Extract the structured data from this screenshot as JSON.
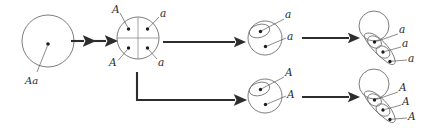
{
  "figure": {
    "background_color": "#ffffff",
    "line_color": "#6e6e6e",
    "arrow_color": "#2d2d2d",
    "nucleus_color": "#1d1d1d"
  },
  "stages": [
    {
      "id": "stage-1",
      "name": "parent-cell",
      "description": "Single round cell with one nucleus",
      "labels": [
        {
          "id": "s1-l1",
          "text": "Aa",
          "name": "label-Aa"
        }
      ]
    },
    {
      "id": "stage-2",
      "name": "four-nucleate-cell",
      "description": "Round cell divided into four quadrants, each containing one nucleus",
      "labels": [
        {
          "id": "s2-l1",
          "text": "A",
          "name": "label-A-top-left"
        },
        {
          "id": "s2-l2",
          "text": "a",
          "name": "label-a-top-right"
        },
        {
          "id": "s2-l3",
          "text": "A",
          "name": "label-A-bottom-left"
        },
        {
          "id": "s2-l4",
          "text": "a",
          "name": "label-a-bottom-right"
        }
      ]
    },
    {
      "id": "stage-3-top",
      "name": "budding-cell-a",
      "description": "Cell with one bud, two nuclei carrying allele a",
      "labels": [
        {
          "id": "s3t-l1",
          "text": "a",
          "name": "label-a-bud"
        },
        {
          "id": "s3t-l2",
          "text": "a",
          "name": "label-a-mother"
        }
      ]
    },
    {
      "id": "stage-3-bottom",
      "name": "budding-cell-A",
      "description": "Cell with one bud, two nuclei carrying allele A",
      "labels": [
        {
          "id": "s3b-l1",
          "text": "A",
          "name": "label-A-bud"
        },
        {
          "id": "s3b-l2",
          "text": "A",
          "name": "label-A-mother"
        }
      ]
    },
    {
      "id": "stage-4-top",
      "name": "bud-chain-a",
      "description": "Mother cell with a chain of three budded cells, each with one nucleus carrying allele a",
      "labels": [
        {
          "id": "s4t-l1",
          "text": "a",
          "name": "label-a-chain-1"
        },
        {
          "id": "s4t-l2",
          "text": "a",
          "name": "label-a-chain-2"
        },
        {
          "id": "s4t-l3",
          "text": "a",
          "name": "label-a-chain-3"
        }
      ]
    },
    {
      "id": "stage-4-bottom",
      "name": "bud-chain-A",
      "description": "Mother cell with a chain of three budded cells, each with one nucleus carrying allele A",
      "labels": [
        {
          "id": "s4b-l1",
          "text": "A",
          "name": "label-A-chain-1"
        },
        {
          "id": "s4b-l2",
          "text": "A",
          "name": "label-A-chain-2"
        },
        {
          "id": "s4b-l3",
          "text": "A",
          "name": "label-A-chain-3"
        }
      ]
    }
  ],
  "arrows": [
    {
      "id": "arrow-1",
      "name": "arrow-stage1-to-stage2-first",
      "direction": "right"
    },
    {
      "id": "arrow-2",
      "name": "arrow-stage1-to-stage2-second",
      "direction": "right"
    },
    {
      "id": "arrow-3",
      "name": "arrow-stage2-to-stage3-top",
      "direction": "right"
    },
    {
      "id": "arrow-4",
      "name": "arrow-stage2-to-stage3-bottom",
      "direction": "right"
    },
    {
      "id": "arrow-5",
      "name": "arrow-stage3-to-stage4-top",
      "direction": "right"
    },
    {
      "id": "arrow-6",
      "name": "arrow-stage3-to-stage4-bottom",
      "direction": "right"
    }
  ]
}
